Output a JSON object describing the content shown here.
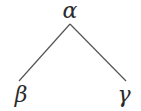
{
  "diagram": {
    "type": "tree",
    "root": {
      "id": "alpha",
      "label": "α"
    },
    "children": [
      {
        "id": "beta",
        "label": "β"
      },
      {
        "id": "gamma",
        "label": "γ"
      }
    ],
    "edges": [
      {
        "from": "alpha",
        "to": "beta"
      },
      {
        "from": "alpha",
        "to": "gamma"
      }
    ],
    "colors": {
      "line": "#555555",
      "text": "#2a2a2a",
      "background": "#ffffff"
    }
  }
}
